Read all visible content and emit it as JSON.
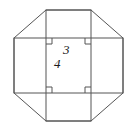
{
  "figure": {
    "type": "geometry-diagram",
    "stroke_color": "#555555",
    "background_color": "#ffffff",
    "text_color": "#1a1a1a",
    "labels": {
      "horizontal_band_height": "3",
      "vertical_band_width": "4"
    },
    "shapes": {
      "octagon": {
        "name": "outer-octagon",
        "points": "14,38 46,10 91,10 123,38 123,93 91,121 46,121 14,93"
      },
      "horizontal_rectangle": {
        "name": "horizontal-band",
        "x": 14,
        "y": 38,
        "width": 109,
        "height": 55
      },
      "vertical_rectangle": {
        "name": "vertical-band",
        "x": 46,
        "y": 10,
        "width": 45,
        "height": 111
      }
    },
    "right_angle_marks": [
      {
        "name": "right-angle-top-left",
        "x": 46,
        "y": 38,
        "dx": 1,
        "dy": 1
      },
      {
        "name": "right-angle-top-right",
        "x": 91,
        "y": 38,
        "dx": -1,
        "dy": 1
      },
      {
        "name": "right-angle-bottom-left",
        "x": 46,
        "y": 93,
        "dx": 1,
        "dy": -1
      },
      {
        "name": "right-angle-bottom-right",
        "x": 91,
        "y": 93,
        "dx": -1,
        "dy": -1
      }
    ]
  }
}
